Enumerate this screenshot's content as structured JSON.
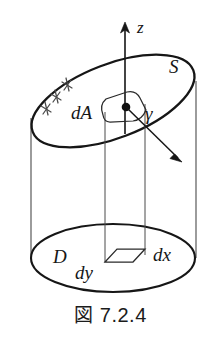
{
  "figure": {
    "caption_label": "図",
    "caption_number": "7.2.4",
    "caption_full": "図 7.2.4",
    "labels": {
      "axis_z": "z",
      "surface_s": "S",
      "area_element": "dA",
      "angle_gamma": "γ",
      "domain_d": "D",
      "differential_y": "dy",
      "differential_x": "dx"
    },
    "icons": {
      "axis_arrow": "up-arrow-icon",
      "normal_arrow": "normal-vector-arrow-icon",
      "point_marker": "filled-dot-icon",
      "hatch_marks": "hatching-marks-icon"
    },
    "colors": {
      "ink": "#161616",
      "background": "#ffffff",
      "thin_line": "#4a4a4a"
    }
  }
}
